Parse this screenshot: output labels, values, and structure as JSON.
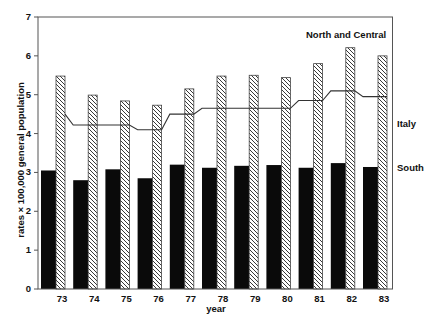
{
  "chart_data": {
    "type": "bar",
    "title": "",
    "xlabel": "year",
    "ylabel": "rates × 100,000 general population",
    "ylim": [
      0,
      7
    ],
    "yticks": [
      0,
      1,
      2,
      3,
      4,
      5,
      6,
      7
    ],
    "grid": false,
    "categories": [
      "73",
      "74",
      "75",
      "76",
      "77",
      "78",
      "79",
      "80",
      "81",
      "82",
      "83"
    ],
    "series": [
      {
        "name": "South",
        "type": "bar",
        "fill": "solid-black",
        "values": [
          3.05,
          2.8,
          3.08,
          2.85,
          3.2,
          3.12,
          3.17,
          3.19,
          3.12,
          3.24,
          3.14
        ]
      },
      {
        "name": "North and Central",
        "type": "bar",
        "fill": "diagonal-hatch",
        "values": [
          5.48,
          4.99,
          4.84,
          4.73,
          5.15,
          5.48,
          5.5,
          5.44,
          5.8,
          6.21,
          6.0
        ]
      },
      {
        "name": "Italy",
        "type": "line",
        "values": [
          4.5,
          4.22,
          4.22,
          4.1,
          4.5,
          4.65,
          4.65,
          4.65,
          4.85,
          5.1,
          4.95
        ]
      }
    ],
    "annotations": [
      {
        "text": "North and Central",
        "position": "top-right inside plot"
      },
      {
        "text": "Italy",
        "position": "right of plot, beside line"
      },
      {
        "text": "South",
        "position": "right of plot, beside black bars"
      }
    ],
    "legend_position": "direct labels at right"
  },
  "labels": {
    "north": "North and Central",
    "italy": "Italy",
    "south": "South",
    "xlabel": "year",
    "ylabel": "rates × 100,000 general population"
  },
  "colors": {
    "south_bar": "#0a0a0a",
    "hatch_line": "#222222",
    "axis": "#333333",
    "background": "#ffffff"
  }
}
